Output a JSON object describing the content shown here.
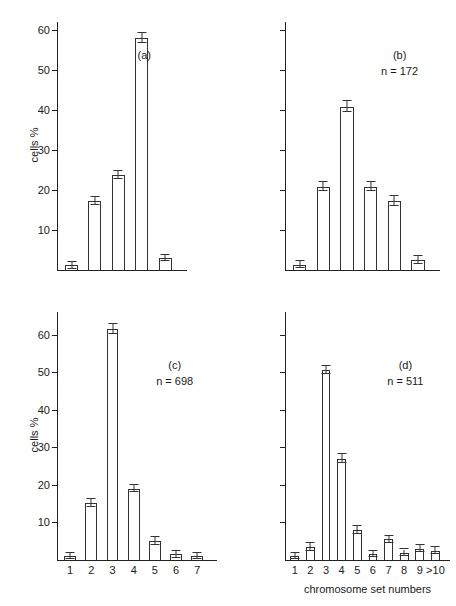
{
  "figure": {
    "y_axis_title": "cells %",
    "x_axis_title": "chromosome set numbers",
    "line_color": "#333333",
    "text_color": "#1a1a1a",
    "background": "#ffffff"
  },
  "chart_data": [
    {
      "type": "bar",
      "panel": "(a)",
      "n_label": "",
      "title": "",
      "xlabel": "",
      "ylabel": "cells %",
      "categories": [
        "1",
        "2",
        "3",
        "4",
        "5"
      ],
      "values": [
        1.2,
        17.3,
        23.8,
        58.0,
        3.0
      ],
      "errors": [
        0.9,
        1.0,
        1.0,
        1.2,
        0.8
      ],
      "ylim": [
        0,
        62
      ],
      "yticks": [
        10,
        20,
        30,
        40,
        50,
        60
      ],
      "ytick_labels": [
        "10",
        "20",
        "30",
        "40",
        "50",
        "60"
      ],
      "show_ytick_labels": true,
      "show_xtick_labels": false,
      "grid": false,
      "legend": "none"
    },
    {
      "type": "bar",
      "panel": "(b)",
      "n_label": "n = 172",
      "title": "",
      "xlabel": "",
      "ylabel": "",
      "categories": [
        "1",
        "2",
        "3",
        "4",
        "5",
        "6"
      ],
      "values": [
        1.3,
        20.8,
        40.8,
        20.8,
        17.3,
        2.5
      ],
      "errors": [
        0.9,
        1.1,
        1.4,
        1.1,
        1.2,
        0.9
      ],
      "ylim": [
        0,
        62
      ],
      "yticks": [
        10,
        20,
        30,
        40,
        50,
        60
      ],
      "ytick_labels": [
        "",
        "",
        "",
        "",
        "",
        ""
      ],
      "show_ytick_labels": false,
      "show_xtick_labels": false,
      "grid": false,
      "legend": "none"
    },
    {
      "type": "bar",
      "panel": "(c)",
      "n_label": "n = 698",
      "title": "",
      "xlabel": "",
      "ylabel": "cells %",
      "categories": [
        "1",
        "2",
        "3",
        "4",
        "5",
        "6",
        "7"
      ],
      "values": [
        1.0,
        15.2,
        61.5,
        19.0,
        5.0,
        1.5,
        1.0
      ],
      "errors": [
        0.8,
        1.1,
        1.3,
        1.0,
        1.0,
        0.9,
        0.8
      ],
      "ylim": [
        0,
        66
      ],
      "yticks": [
        10,
        20,
        30,
        40,
        50,
        60
      ],
      "ytick_labels": [
        "10",
        "20",
        "30",
        "40",
        "50",
        "60"
      ],
      "show_ytick_labels": true,
      "show_xtick_labels": true,
      "grid": false,
      "legend": "none"
    },
    {
      "type": "bar",
      "panel": "(d)",
      "n_label": "n = 511",
      "title": "",
      "xlabel": "chromosome set numbers",
      "ylabel": "",
      "categories": [
        "1",
        "2",
        "3",
        "4",
        "5",
        "6",
        "7",
        "8",
        "9",
        ">10"
      ],
      "values": [
        1.0,
        3.5,
        50.5,
        27.0,
        8.0,
        1.5,
        5.5,
        2.0,
        3.0,
        2.5
      ],
      "errors": [
        0.8,
        1.0,
        1.1,
        1.1,
        1.0,
        0.8,
        1.0,
        0.8,
        0.9,
        0.9
      ],
      "ylim": [
        0,
        66
      ],
      "yticks": [
        10,
        20,
        30,
        40,
        50,
        60
      ],
      "ytick_labels": [
        "",
        "",
        "",
        "",
        "",
        ""
      ],
      "show_ytick_labels": false,
      "show_xtick_labels": true,
      "grid": false,
      "legend": "none"
    }
  ]
}
